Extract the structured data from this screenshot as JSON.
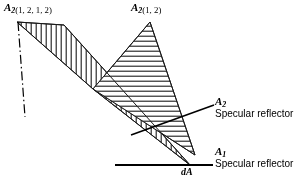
{
  "figure": {
    "background_color": "#ffffff",
    "line_color": "#000000",
    "width": 304,
    "height": 183
  },
  "labels": {
    "a2_1212": {
      "symbol": "A",
      "subscript": "2",
      "args": "(1, 2, 1, 2)"
    },
    "a2_12": {
      "symbol": "A",
      "subscript": "2",
      "args": "(1, 2)"
    },
    "a2_specular": {
      "symbol": "A",
      "subscript": "2",
      "caption": "Specular reflector"
    },
    "a1_specular": {
      "symbol": "A",
      "subscript": "1",
      "caption": "Specular reflector"
    },
    "da": {
      "symbol": "dA"
    }
  },
  "regions": {
    "band_vertical_hatch": {
      "name": "A2(1, 2, 1, 2) beam band",
      "hatch": "vertical",
      "points": "17,22 64,25 190,165 93,89"
    },
    "triangle_horizontal_hatch": {
      "name": "A2(1, 2) beam triangle",
      "hatch": "horizontal",
      "points": "150,22 195,155 93,89"
    }
  },
  "lines": {
    "baseline_a1": {
      "name": "A1 specular reflector surface",
      "x1": 115,
      "y1": 165,
      "x2": 213,
      "y2": 165,
      "width": 2.0
    },
    "dash_dot_axis": {
      "name": "centerline axis",
      "x1": 18,
      "y1": 22,
      "x2": 25,
      "y2": 117,
      "pattern": "dash-dot"
    },
    "leader_a2": {
      "name": "leader to A2 specular reflector",
      "x1": 131,
      "y1": 135,
      "x2": 214,
      "y2": 105
    },
    "leader_a1": {
      "name": "leader to A1 specular reflector",
      "x1": 198,
      "y1": 165,
      "x2": 213,
      "y2": 165
    }
  }
}
